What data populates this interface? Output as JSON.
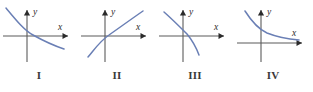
{
  "figure": {
    "background_color": "#ffffff",
    "curve_color": "#6a7fb5",
    "axis_color": "#5b5b5b",
    "label_color": "#3a3a3a",
    "axis_label_x": "x",
    "axis_label_y": "y"
  },
  "panels": [
    {
      "label": "I",
      "description": "decreasing curve, concave up, passing through the origin",
      "curve_path": "M 6,8 C 16,20 24,30 33,35 C 42,40 52,45 64,49",
      "x_axis": {
        "x1": 3,
        "y1": 36,
        "x2": 68,
        "y2": 36
      },
      "y_axis": {
        "x1": 27,
        "y1": 62,
        "x2": 27,
        "y2": 10
      },
      "x_label_pos": {
        "x": 58,
        "y": 30
      },
      "y_label_pos": {
        "x": 33,
        "y": 15
      }
    },
    {
      "label": "II",
      "description": "increasing curve, concave down, passing through the origin",
      "curve_path": "M 10,57 C 16,50 22,41 31,35 C 41,28 52,20 65,11",
      "x_axis": {
        "x1": 3,
        "y1": 36,
        "x2": 68,
        "y2": 36
      },
      "y_axis": {
        "x1": 27,
        "y1": 62,
        "x2": 27,
        "y2": 10
      },
      "x_label_pos": {
        "x": 58,
        "y": 30
      },
      "y_label_pos": {
        "x": 33,
        "y": 15
      }
    },
    {
      "label": "III",
      "description": "decreasing curve, concave down, crossing the x-axis right of the origin",
      "curve_path": "M 8,12 C 16,19 24,27 31,34 C 36,40 40,47 43,55",
      "x_axis": {
        "x1": 3,
        "y1": 36,
        "x2": 68,
        "y2": 36
      },
      "y_axis": {
        "x1": 27,
        "y1": 62,
        "x2": 27,
        "y2": 10
      },
      "x_label_pos": {
        "x": 58,
        "y": 30
      },
      "y_label_pos": {
        "x": 33,
        "y": 15
      }
    },
    {
      "label": "IV",
      "description": "decreasing curve, concave up, approaching the x-axis asymptotically from above",
      "curve_path": "M 11,11 C 18,22 24,29 33,33 C 43,37 53,39 65,40",
      "x_axis": {
        "x1": 3,
        "y1": 43,
        "x2": 68,
        "y2": 43
      },
      "y_axis": {
        "x1": 27,
        "y1": 62,
        "x2": 27,
        "y2": 10
      },
      "x_label_pos": {
        "x": 58,
        "y": 36
      },
      "y_label_pos": {
        "x": 33,
        "y": 15
      }
    }
  ]
}
